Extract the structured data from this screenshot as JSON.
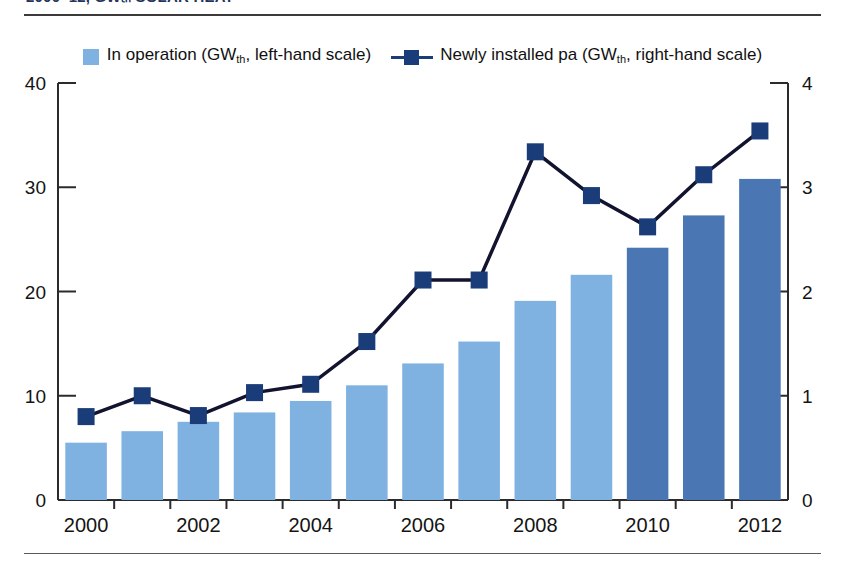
{
  "caption": {
    "text": "2000–12, GWₜₕ            SOLAR HEAT"
  },
  "legend": {
    "items": [
      {
        "marker": "bar-swatch",
        "color": "#7fb2e0",
        "label_pre": "In operation (GW",
        "label_sub": "th",
        "label_post": ", left-hand scale)"
      },
      {
        "marker": "line-square",
        "color": "#1a3c78",
        "label_pre": "Newly installed pa (GW",
        "label_sub": "th",
        "label_post": ", right-hand scale)"
      }
    ]
  },
  "chart_data": {
    "type": "bar",
    "title": "",
    "subtitle": "",
    "xlabel": "",
    "ylabel": "",
    "grid": false,
    "legend_position": "top-center",
    "categories": [
      "2000",
      "2001",
      "2002",
      "2003",
      "2004",
      "2005",
      "2006",
      "2007",
      "2008",
      "2009",
      "2010",
      "2011",
      "2012"
    ],
    "xtick_labels": [
      "2000",
      "",
      "2002",
      "",
      "2004",
      "",
      "2006",
      "",
      "2008",
      "",
      "2010",
      "",
      "2012"
    ],
    "left_axis": {
      "label": "In operation (GWth)",
      "ticks": [
        "0",
        "10",
        "20",
        "30",
        "40"
      ],
      "tick_values": [
        0,
        10,
        20,
        30,
        40
      ],
      "ylim": [
        0,
        40
      ]
    },
    "right_axis": {
      "label": "Newly installed pa (GWth)",
      "ticks": [
        "0",
        "1",
        "2",
        "3",
        "4"
      ],
      "tick_values": [
        0,
        1,
        2,
        3,
        4
      ],
      "ylim": [
        0,
        4
      ]
    },
    "series": [
      {
        "name": "In operation (GWth, left-hand scale)",
        "type": "bar",
        "axis": "left",
        "color": "#7fb2e0",
        "highlight_color": "#4a77b4",
        "highlight_categories": [
          "2010",
          "2011",
          "2012"
        ],
        "values": [
          5.5,
          6.6,
          7.5,
          8.4,
          9.5,
          11.0,
          13.1,
          15.2,
          19.1,
          21.6,
          24.2,
          27.3,
          30.8
        ]
      },
      {
        "name": "Newly installed pa (GWth, right-hand scale)",
        "type": "line",
        "axis": "right",
        "color": "#12132e",
        "marker_color": "#1a3c78",
        "values": [
          0.8,
          1.0,
          0.81,
          1.03,
          1.11,
          1.52,
          2.11,
          2.11,
          3.34,
          2.92,
          2.62,
          3.12,
          3.54
        ]
      }
    ]
  }
}
